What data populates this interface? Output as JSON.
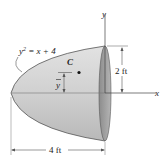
{
  "figure": {
    "equation": {
      "base": "y",
      "exp": "2",
      "rest": " = x + 4"
    },
    "centroid_label": "C",
    "ybar_label": "y",
    "axis_y_label": "y",
    "axis_x_label": "x",
    "dim_height": "2 ft",
    "dim_length": "4 ft"
  },
  "colors": {
    "body_fill": "#d4d4d4",
    "face_fill": "#9a9a9a",
    "outline": "#555555"
  }
}
